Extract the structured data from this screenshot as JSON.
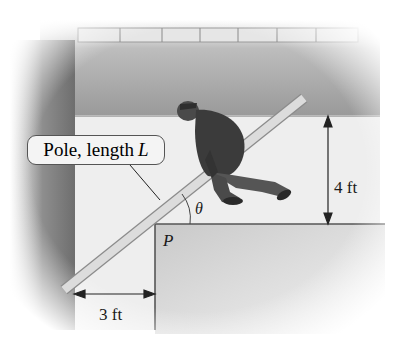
{
  "diagram": {
    "callout": {
      "text": "Pole, length ",
      "variable": "L"
    },
    "dimensions": {
      "upper_hall_width": "4 ft",
      "lower_hall_width": "3 ft"
    },
    "point_label": "P",
    "angle_label": "θ",
    "colors": {
      "wall_shadow": "#8a8a8a",
      "floor": "#eeeeee",
      "pole": "#d9d9d9",
      "figure": "#3a3a3a",
      "line": "#333333"
    }
  }
}
